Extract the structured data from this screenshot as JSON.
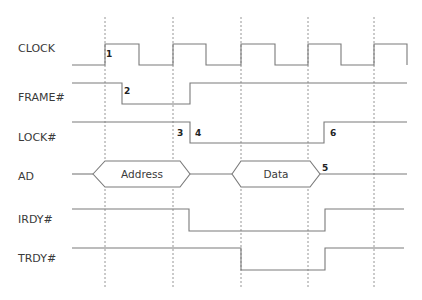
{
  "diagram": {
    "signals": [
      {
        "name": "CLOCK",
        "label_y": 48
      },
      {
        "name": "FRAME#",
        "label_y": 97
      },
      {
        "name": "LOCK#",
        "label_y": 137
      },
      {
        "name": "AD",
        "label_y": 176
      },
      {
        "name": "IRDY#",
        "label_y": 219
      },
      {
        "name": "TRDY#",
        "label_y": 258
      }
    ],
    "bus_phases": [
      {
        "label": "Address",
        "x_start": 93,
        "x_end": 190
      },
      {
        "label": "Data",
        "x_start": 232,
        "x_end": 320
      }
    ],
    "annotations": [
      {
        "text": "1",
        "x": 106,
        "y": 57
      },
      {
        "text": "2",
        "x": 124,
        "y": 94
      },
      {
        "text": "3",
        "x": 177,
        "y": 136
      },
      {
        "text": "4",
        "x": 195,
        "y": 136
      },
      {
        "text": "5",
        "x": 322,
        "y": 171
      },
      {
        "text": "6",
        "x": 330,
        "y": 136
      }
    ],
    "clock_edges_x": [
      105,
      173,
      241,
      308,
      374
    ],
    "colors": {
      "waveform": "#7a7a7a",
      "guide": "#8a8a8a",
      "text": "#3a3a3a"
    }
  }
}
